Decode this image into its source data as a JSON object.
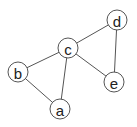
{
  "graph": {
    "nodes": [
      {
        "id": "a",
        "label": "a",
        "x": 60,
        "y": 109
      },
      {
        "id": "b",
        "label": "b",
        "x": 18,
        "y": 72
      },
      {
        "id": "c",
        "label": "c",
        "x": 68,
        "y": 48
      },
      {
        "id": "d",
        "label": "d",
        "x": 117,
        "y": 20
      },
      {
        "id": "e",
        "label": "e",
        "x": 114,
        "y": 82
      }
    ],
    "edges": [
      [
        "c",
        "d"
      ],
      [
        "c",
        "b"
      ],
      [
        "c",
        "a"
      ],
      [
        "c",
        "e"
      ],
      [
        "b",
        "a"
      ],
      [
        "d",
        "e"
      ]
    ],
    "node_radius": 10
  }
}
